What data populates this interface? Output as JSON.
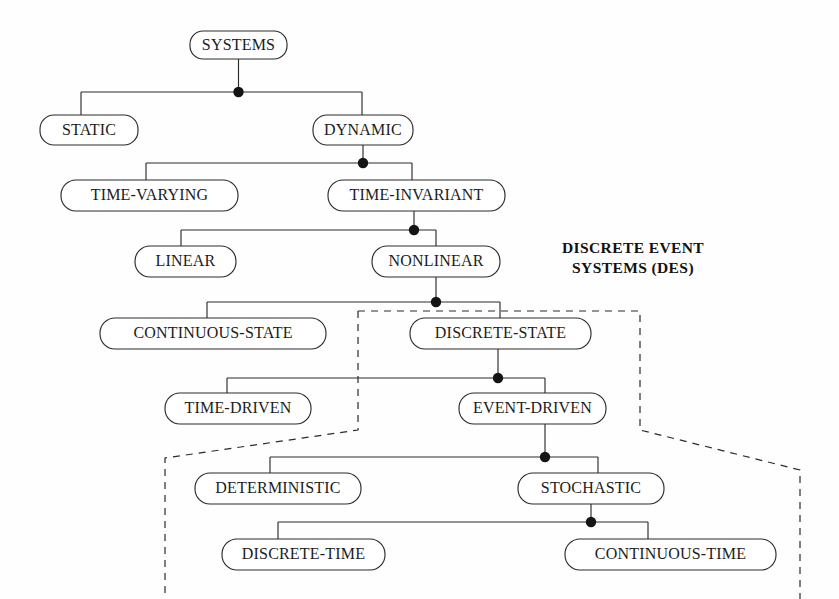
{
  "diagram": {
    "background_color": "#fefefe",
    "line_color": "#2b2b2b",
    "text_color": "#1c1c1c",
    "node_fill": "#ffffff",
    "dot_color": "#141414"
  },
  "nodes": {
    "systems": {
      "label": "SYSTEMS",
      "x": 190,
      "y": 31,
      "w": 97,
      "h": 28,
      "cx": 238.5,
      "cy": 45
    },
    "static": {
      "label": "STATIC",
      "x": 40,
      "y": 115,
      "w": 98,
      "h": 30,
      "cx": 89,
      "cy": 130
    },
    "dynamic": {
      "label": "DYNAMIC",
      "x": 313,
      "y": 115,
      "w": 100,
      "h": 30,
      "cx": 363,
      "cy": 130
    },
    "time_varying": {
      "label": "TIME-VARYING",
      "x": 61,
      "y": 180,
      "w": 177,
      "h": 31,
      "cx": 149.5,
      "cy": 195.5
    },
    "time_invariant": {
      "label": "TIME-INVARIANT",
      "x": 328,
      "y": 180,
      "w": 177,
      "h": 31,
      "cx": 416.5,
      "cy": 195.5
    },
    "linear": {
      "label": "LINEAR",
      "x": 135,
      "y": 246,
      "w": 101,
      "h": 31,
      "cx": 185.5,
      "cy": 261.5
    },
    "nonlinear": {
      "label": "NONLINEAR",
      "x": 372,
      "y": 246,
      "w": 128,
      "h": 31,
      "cx": 436,
      "cy": 261.5
    },
    "continuous_state": {
      "label": "CONTINUOUS-STATE",
      "x": 100,
      "y": 318,
      "w": 226,
      "h": 31,
      "cx": 213,
      "cy": 333.5
    },
    "discrete_state": {
      "label": "DISCRETE-STATE",
      "x": 410,
      "y": 318,
      "w": 181,
      "h": 31,
      "cx": 500.5,
      "cy": 333.5
    },
    "time_driven": {
      "label": "TIME-DRIVEN",
      "x": 165,
      "y": 393,
      "w": 146,
      "h": 31,
      "cx": 238,
      "cy": 408.5
    },
    "event_driven": {
      "label": "EVENT-DRIVEN",
      "x": 459,
      "y": 393,
      "w": 147,
      "h": 31,
      "cx": 532.5,
      "cy": 408.5
    },
    "deterministic": {
      "label": "DETERMINISTIC",
      "x": 195,
      "y": 473,
      "w": 166,
      "h": 31,
      "cx": 278,
      "cy": 488.5
    },
    "stochastic": {
      "label": "STOCHASTIC",
      "x": 518,
      "y": 473,
      "w": 146,
      "h": 31,
      "cx": 591,
      "cy": 488.5
    },
    "discrete_time": {
      "label": "DISCRETE-TIME",
      "x": 222,
      "y": 539,
      "w": 163,
      "h": 31,
      "cx": 303.5,
      "cy": 554.5
    },
    "continuous_time": {
      "label": "CONTINUOUS-TIME",
      "x": 565,
      "y": 539,
      "w": 211,
      "h": 31,
      "cx": 670.5,
      "cy": 554.5
    }
  },
  "annotations": {
    "des_label_line1": "DISCRETE EVENT",
    "des_label_line2": "SYSTEMS (DES)",
    "des_label_cx": 633,
    "des_label_y1": 253,
    "des_label_y2": 273
  },
  "hierarchy": [
    {
      "parent": "SYSTEMS",
      "children": [
        "STATIC",
        "DYNAMIC"
      ]
    },
    {
      "parent": "DYNAMIC",
      "children": [
        "TIME-VARYING",
        "TIME-INVARIANT"
      ]
    },
    {
      "parent": "TIME-INVARIANT",
      "children": [
        "LINEAR",
        "NONLINEAR"
      ]
    },
    {
      "parent": "NONLINEAR",
      "children": [
        "CONTINUOUS-STATE",
        "DISCRETE-STATE"
      ]
    },
    {
      "parent": "DISCRETE-STATE",
      "children": [
        "TIME-DRIVEN",
        "EVENT-DRIVEN"
      ]
    },
    {
      "parent": "EVENT-DRIVEN",
      "children": [
        "DETERMINISTIC",
        "STOCHASTIC"
      ]
    },
    {
      "parent": "STOCHASTIC",
      "children": [
        "DISCRETE-TIME",
        "CONTINUOUS-TIME"
      ]
    }
  ]
}
